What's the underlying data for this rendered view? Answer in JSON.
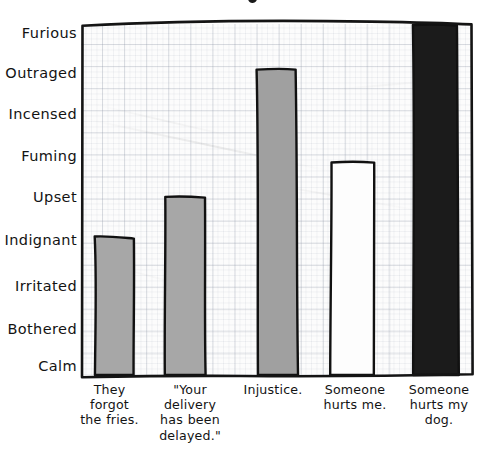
{
  "chart_data": {
    "type": "bar",
    "title": "",
    "xlabel": "",
    "ylabel": "",
    "grid": true,
    "legend": false,
    "categories": [
      "They forgot the fries.",
      "\"Your delivery has been delayed.\"",
      "Injustice.",
      "Someone hurts me.",
      "Someone hurts my dog."
    ],
    "category_lines": [
      [
        "They",
        "forgot",
        "the fries."
      ],
      [
        "\"Your",
        "delivery",
        "has been",
        "delayed.\""
      ],
      [
        "Injustice."
      ],
      [
        "Someone",
        "hurts me."
      ],
      [
        "Someone",
        "hurts my",
        "dog."
      ]
    ],
    "ytick_labels": [
      "Furious",
      "Outraged",
      "Incensed",
      "Fuming",
      "Upset",
      "Indignant",
      "Irritated",
      "Bothered",
      "Calm"
    ],
    "ytick_values": [
      8,
      7,
      6,
      5,
      4,
      3,
      2,
      1,
      0
    ],
    "ylim": [
      0,
      8.2
    ],
    "values": [
      3.1,
      4.1,
      7.1,
      5.1,
      8.2
    ],
    "value_labels": [
      "Indignant",
      "Upset",
      "Outraged",
      "Fuming",
      "Furious"
    ],
    "bar_colors": [
      "#a7a7a7",
      "#a7a7a7",
      "#a0a0a0",
      "#fdfdfd",
      "#1b1b1b"
    ],
    "bar_edge_color": "#111111",
    "grid_color": "#96a0ac",
    "plot_background": "#fcfcfc",
    "style": "hand-drawn xkcd"
  },
  "bars": [
    {
      "index": 0,
      "name": "bar-fries",
      "left": 15,
      "width": 38,
      "top": 214,
      "fill": "#a7a7a7",
      "label": "Indignant"
    },
    {
      "index": 1,
      "name": "bar-delivery",
      "left": 84,
      "width": 40,
      "top": 173,
      "fill": "#a7a7a7",
      "label": "Upset"
    },
    {
      "index": 2,
      "name": "bar-injustice",
      "left": 177,
      "width": 39,
      "top": 45,
      "fill": "#a0a0a0",
      "label": "Outraged"
    },
    {
      "index": 3,
      "name": "bar-hurts-me",
      "left": 250,
      "width": 43,
      "top": 138,
      "fill": "#fdfdfd",
      "label": "Fuming"
    },
    {
      "index": 4,
      "name": "bar-hurts-dog",
      "left": 333,
      "width": 44,
      "top": 1,
      "fill": "#1b1b1b",
      "label": "Furious"
    }
  ],
  "ytick_positions": [
    33,
    73,
    114,
    156,
    197,
    240,
    286,
    329,
    366
  ],
  "xlabel_boxes": [
    {
      "left": 62,
      "width": 95
    },
    {
      "left": 144,
      "width": 92
    },
    {
      "left": 227,
      "width": 92
    },
    {
      "left": 306,
      "width": 98
    },
    {
      "left": 390,
      "width": 98
    }
  ]
}
